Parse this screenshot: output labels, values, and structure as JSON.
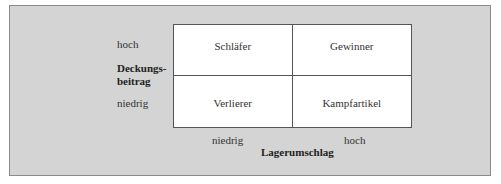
{
  "diagram": {
    "y_axis": {
      "title": "Deckungs-\nbeitrag",
      "title_line1": "Deckungs-",
      "title_line2": "beitrag",
      "high": "hoch",
      "low": "niedrig"
    },
    "x_axis": {
      "title": "Lagerumschlag",
      "low": "niedrig",
      "high": "hoch"
    },
    "quadrants": [
      {
        "position": "top-left",
        "label": "Schläfer"
      },
      {
        "position": "top-right",
        "label": "Gewinner"
      },
      {
        "position": "bottom-left",
        "label": "Verlierer"
      },
      {
        "position": "bottom-right",
        "label": "Kampfartikel"
      }
    ],
    "colors": {
      "panel": "#d4d4d4",
      "matrix": "#ffffff",
      "lines": "#555555"
    }
  }
}
